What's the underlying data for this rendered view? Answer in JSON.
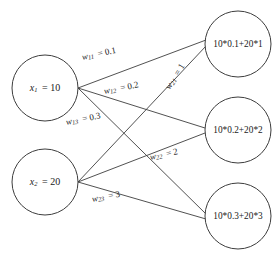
{
  "diagram": {
    "background_color": "#ffffff",
    "stroke_color": "#3d3d3d",
    "text_color": "#1a1a1a",
    "input_nodes": [
      {
        "id": "x1",
        "var": "x",
        "subscript": "1",
        "equals": "= 10",
        "value": "10",
        "label": "x1 = 10",
        "cx": 45,
        "cy": 88,
        "r": 33
      },
      {
        "id": "x2",
        "var": "x",
        "subscript": "2",
        "equals": "= 20",
        "value": "20",
        "label": "x2 = 20",
        "cx": 45,
        "cy": 182,
        "r": 33
      }
    ],
    "output_nodes": [
      {
        "id": "o1",
        "label": "10*0.1+20*1",
        "cx": 238,
        "cy": 44,
        "r": 33
      },
      {
        "id": "o2",
        "label": "10*0.2+20*2",
        "cx": 238,
        "cy": 130,
        "r": 33
      },
      {
        "id": "o3",
        "label": "10*0.3+20*3",
        "cx": 238,
        "cy": 216,
        "r": 33
      }
    ],
    "edges": [
      {
        "id": "e11",
        "from": "x1",
        "to": "o1",
        "var": "w",
        "subscript": "11",
        "equals": "= 0.1",
        "weight": "0.1",
        "label": "w11 = 0.1",
        "lx": 82,
        "ly": 58,
        "rotate": -12
      },
      {
        "id": "e12",
        "from": "x1",
        "to": "o2",
        "var": "w",
        "subscript": "12",
        "equals": "= 0.2",
        "weight": "0.2",
        "label": "w12 = 0.2",
        "lx": 104,
        "ly": 92,
        "rotate": -11
      },
      {
        "id": "e13",
        "from": "x1",
        "to": "o3",
        "var": "w",
        "subscript": "13",
        "equals": "= 0.3",
        "weight": "0.3",
        "label": "w13 = 0.3",
        "lx": 66,
        "ly": 123,
        "rotate": -11
      },
      {
        "id": "e21",
        "from": "x2",
        "to": "o1",
        "var": "w",
        "subscript": "21",
        "equals": "= 1",
        "weight": "1",
        "label": "w21 = 1",
        "lx": 168,
        "ly": 89,
        "rotate": -58
      },
      {
        "id": "e22",
        "from": "x2",
        "to": "o2",
        "var": "w",
        "subscript": "22",
        "equals": "= 2",
        "weight": "2",
        "label": "w22 = 2",
        "lx": 150,
        "ly": 158,
        "rotate": -12
      },
      {
        "id": "e23",
        "from": "x2",
        "to": "o3",
        "var": "w",
        "subscript": "23",
        "equals": "= 3",
        "weight": "3",
        "label": "w23 = 3",
        "lx": 92,
        "ly": 200,
        "rotate": -11
      }
    ]
  }
}
